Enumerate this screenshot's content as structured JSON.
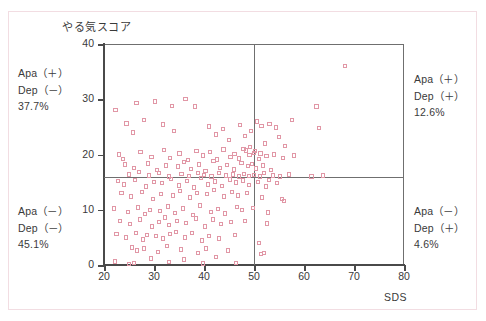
{
  "chart_data": {
    "type": "scatter",
    "title": "",
    "ylabel": "やる気スコア",
    "xlabel": "SDS",
    "xlim": [
      20,
      80
    ],
    "ylim": [
      0,
      40
    ],
    "xticks": [
      20,
      30,
      40,
      50,
      60,
      70,
      80
    ],
    "yticks": [
      0,
      10,
      20,
      30,
      40
    ],
    "grid": false,
    "legend": null,
    "reference_lines": {
      "vertical_x": 50,
      "horizontal_y": 16
    },
    "marker": {
      "shape": "open-square",
      "color": "#e197a6",
      "size": 4
    },
    "quadrant_labels": [
      {
        "position": "top-left",
        "line1": "Apa（＋）",
        "line2": "Dep（－）",
        "percent": "37.7%"
      },
      {
        "position": "top-right",
        "line1": "Apa（＋）",
        "line2": "Dep（＋）",
        "percent": "12.6%"
      },
      {
        "position": "bottom-left",
        "line1": "Apa（－）",
        "line2": "Dep（－）",
        "percent": "45.1%"
      },
      {
        "position": "bottom-right",
        "line1": "Apa（－）",
        "line2": "Dep（＋）",
        "percent": "4.6%"
      }
    ],
    "points": [
      [
        22.3,
        28.0
      ],
      [
        26.5,
        29.3
      ],
      [
        30.2,
        29.6
      ],
      [
        33.6,
        28.8
      ],
      [
        36.3,
        30.0
      ],
      [
        38.2,
        28.7
      ],
      [
        24.5,
        25.6
      ],
      [
        25.8,
        24.0
      ],
      [
        28.0,
        26.2
      ],
      [
        31.8,
        25.4
      ],
      [
        34.0,
        24.3
      ],
      [
        41.0,
        25.1
      ],
      [
        42.4,
        23.6
      ],
      [
        43.8,
        24.6
      ],
      [
        45.0,
        22.6
      ],
      [
        47.2,
        25.3
      ],
      [
        48.2,
        23.4
      ],
      [
        49.4,
        24.2
      ],
      [
        50.6,
        26.0
      ],
      [
        51.5,
        25.2
      ],
      [
        53.1,
        25.5
      ],
      [
        54.4,
        24.9
      ],
      [
        55.0,
        23.2
      ],
      [
        57.6,
        26.2
      ],
      [
        52.2,
        22.0
      ],
      [
        56.2,
        21.5
      ],
      [
        47.9,
        21.0
      ],
      [
        49.2,
        21.4
      ],
      [
        50.2,
        20.6
      ],
      [
        51.3,
        20.2
      ],
      [
        62.5,
        28.7
      ],
      [
        68.2,
        36.0
      ],
      [
        63.0,
        24.8
      ],
      [
        23.0,
        20.0
      ],
      [
        23.8,
        19.2
      ],
      [
        27.3,
        20.5
      ],
      [
        29.5,
        19.6
      ],
      [
        32.0,
        20.8
      ],
      [
        33.2,
        19.4
      ],
      [
        35.1,
        20.2
      ],
      [
        36.8,
        19.0
      ],
      [
        38.5,
        20.6
      ],
      [
        39.8,
        19.8
      ],
      [
        41.2,
        20.4
      ],
      [
        42.6,
        19.1
      ],
      [
        43.9,
        20.9
      ],
      [
        45.3,
        19.5
      ],
      [
        46.1,
        20.1
      ],
      [
        47.0,
        19.3
      ],
      [
        48.4,
        20.7
      ],
      [
        49.1,
        19.9
      ],
      [
        50.0,
        20.3
      ],
      [
        51.0,
        19.2
      ],
      [
        52.5,
        19.7
      ],
      [
        54.0,
        20.0
      ],
      [
        55.8,
        19.4
      ],
      [
        58.0,
        19.8
      ],
      [
        24.2,
        18.2
      ],
      [
        26.0,
        17.6
      ],
      [
        28.8,
        18.4
      ],
      [
        30.6,
        17.2
      ],
      [
        32.4,
        18.0
      ],
      [
        34.8,
        17.8
      ],
      [
        36.0,
        18.6
      ],
      [
        37.4,
        17.4
      ],
      [
        39.0,
        18.2
      ],
      [
        40.3,
        17.0
      ],
      [
        41.9,
        18.8
      ],
      [
        43.2,
        17.6
      ],
      [
        44.6,
        18.1
      ],
      [
        46.0,
        17.3
      ],
      [
        47.5,
        18.5
      ],
      [
        48.8,
        17.9
      ],
      [
        49.6,
        18.3
      ],
      [
        50.4,
        17.5
      ],
      [
        51.8,
        18.0
      ],
      [
        53.4,
        17.2
      ],
      [
        25.0,
        16.4
      ],
      [
        27.0,
        16.8
      ],
      [
        29.0,
        16.2
      ],
      [
        31.0,
        16.6
      ],
      [
        33.0,
        16.0
      ],
      [
        35.5,
        16.5
      ],
      [
        37.0,
        16.1
      ],
      [
        38.8,
        16.7
      ],
      [
        40.0,
        16.3
      ],
      [
        41.5,
        16.0
      ],
      [
        43.0,
        16.6
      ],
      [
        44.4,
        16.2
      ],
      [
        45.8,
        16.4
      ],
      [
        47.0,
        16.0
      ],
      [
        48.0,
        16.5
      ],
      [
        49.0,
        16.1
      ],
      [
        50.0,
        16.3
      ],
      [
        51.2,
        16.0
      ],
      [
        52.0,
        16.6
      ],
      [
        53.8,
        16.2
      ],
      [
        55.2,
        16.0
      ],
      [
        57.0,
        16.4
      ],
      [
        61.5,
        16.0
      ],
      [
        63.8,
        16.2
      ],
      [
        22.8,
        15.2
      ],
      [
        24.0,
        14.6
      ],
      [
        26.2,
        15.4
      ],
      [
        28.4,
        14.2
      ],
      [
        30.0,
        15.0
      ],
      [
        31.6,
        14.8
      ],
      [
        33.4,
        15.6
      ],
      [
        35.0,
        14.4
      ],
      [
        36.6,
        15.2
      ],
      [
        38.0,
        14.0
      ],
      [
        39.4,
        15.8
      ],
      [
        40.8,
        14.6
      ],
      [
        42.2,
        15.1
      ],
      [
        43.6,
        14.3
      ],
      [
        45.2,
        15.5
      ],
      [
        46.4,
        14.9
      ],
      [
        47.8,
        15.3
      ],
      [
        49.0,
        14.5
      ],
      [
        50.8,
        15.0
      ],
      [
        52.4,
        14.2
      ],
      [
        53.0,
        15.4
      ],
      [
        54.6,
        14.8
      ],
      [
        23.5,
        13.0
      ],
      [
        25.4,
        12.4
      ],
      [
        27.6,
        13.2
      ],
      [
        29.8,
        12.0
      ],
      [
        31.4,
        12.8
      ],
      [
        33.8,
        12.6
      ],
      [
        35.2,
        13.4
      ],
      [
        37.2,
        12.2
      ],
      [
        38.6,
        13.0
      ],
      [
        40.6,
        12.8
      ],
      [
        42.0,
        13.6
      ],
      [
        44.0,
        12.4
      ],
      [
        45.6,
        13.2
      ],
      [
        46.8,
        12.6
      ],
      [
        48.6,
        13.0
      ],
      [
        51.6,
        12.2
      ],
      [
        55.6,
        12.0
      ],
      [
        22.0,
        10.2
      ],
      [
        24.8,
        9.6
      ],
      [
        26.8,
        10.4
      ],
      [
        28.2,
        9.2
      ],
      [
        29.2,
        10.0
      ],
      [
        31.2,
        9.8
      ],
      [
        32.8,
        10.6
      ],
      [
        34.2,
        9.4
      ],
      [
        35.8,
        10.2
      ],
      [
        37.8,
        9.0
      ],
      [
        39.2,
        10.8
      ],
      [
        41.4,
        9.6
      ],
      [
        42.8,
        10.1
      ],
      [
        44.2,
        9.3
      ],
      [
        46.6,
        10.5
      ],
      [
        47.6,
        9.9
      ],
      [
        49.8,
        10.3
      ],
      [
        52.8,
        9.5
      ],
      [
        23.2,
        8.0
      ],
      [
        25.2,
        7.4
      ],
      [
        27.2,
        8.2
      ],
      [
        29.6,
        7.0
      ],
      [
        31.0,
        7.8
      ],
      [
        32.2,
        8.6
      ],
      [
        33.0,
        7.2
      ],
      [
        34.6,
        8.0
      ],
      [
        36.4,
        7.6
      ],
      [
        38.4,
        8.4
      ],
      [
        40.2,
        7.0
      ],
      [
        41.8,
        8.2
      ],
      [
        43.4,
        7.4
      ],
      [
        45.4,
        7.8
      ],
      [
        48.2,
        8.0
      ],
      [
        52.6,
        7.5
      ],
      [
        22.5,
        5.6
      ],
      [
        24.4,
        5.0
      ],
      [
        26.4,
        5.8
      ],
      [
        27.8,
        4.6
      ],
      [
        28.6,
        5.4
      ],
      [
        30.4,
        5.2
      ],
      [
        31.8,
        4.8
      ],
      [
        33.2,
        5.6
      ],
      [
        34.4,
        6.0
      ],
      [
        36.2,
        5.0
      ],
      [
        37.6,
        5.8
      ],
      [
        39.6,
        4.4
      ],
      [
        41.0,
        5.2
      ],
      [
        43.0,
        4.8
      ],
      [
        46.2,
        5.4
      ],
      [
        51.0,
        4.0
      ],
      [
        25.6,
        3.2
      ],
      [
        26.6,
        2.6
      ],
      [
        28.0,
        3.0
      ],
      [
        30.8,
        2.4
      ],
      [
        32.6,
        3.4
      ],
      [
        35.4,
        2.8
      ],
      [
        38.8,
        2.2
      ],
      [
        40.4,
        3.0
      ],
      [
        44.8,
        2.6
      ],
      [
        51.4,
        2.0
      ],
      [
        56.0,
        11.6
      ],
      [
        52.0,
        2.2
      ],
      [
        22.2,
        0.6
      ],
      [
        25.0,
        0.2
      ],
      [
        26.0,
        0.4
      ],
      [
        33.0,
        0.5
      ],
      [
        39.8,
        0.3
      ],
      [
        46.4,
        0.4
      ],
      [
        29.4,
        1.2
      ],
      [
        36.0,
        1.0
      ],
      [
        42.4,
        1.4
      ]
    ]
  }
}
